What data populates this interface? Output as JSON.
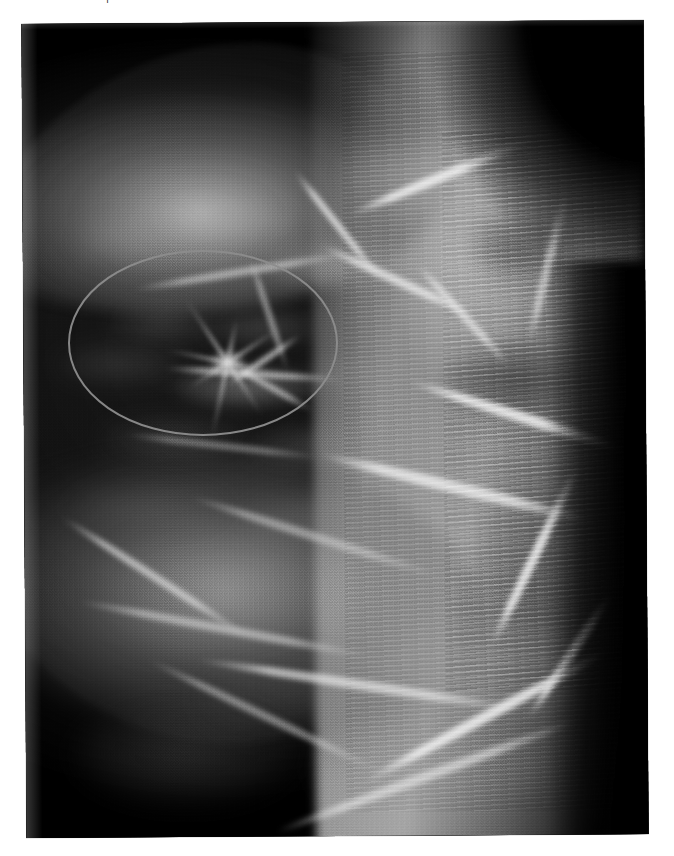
{
  "page": {
    "background_color": "#ffffff",
    "cut_text_fragment": "|"
  },
  "figure": {
    "name": "mammogram-radiograph",
    "modality": "Mammography",
    "view": "MLO (mediolateral oblique)",
    "plate": {
      "left": 24,
      "top": 22,
      "width": 622,
      "height": 814,
      "rotation_deg": -0.35,
      "background_color": "#050505"
    },
    "grayscale": {
      "darkest": "#000000",
      "fat_tissue": "#141414",
      "mid_tissue": "#8a8a8a",
      "dense_tissue": "#c8c8c8",
      "brightest": "#f2f2f2"
    }
  },
  "annotation": {
    "type": "ellipse",
    "label": "region-of-interest",
    "meaning": "spiculated mass / architectural distortion",
    "stroke_color": "#8d8d8d",
    "stroke_width": 2,
    "center_x": 203,
    "center_y": 343,
    "radius_x": 135,
    "radius_y": 93,
    "bounds": {
      "left": 91,
      "top": 272,
      "right": 362,
      "bottom": 458
    }
  },
  "findings": [
    {
      "name": "spiculated-mass",
      "center_x": 228,
      "center_y": 362,
      "description": "Small high-density focus with radiating spicules at the centre of the marked ellipse."
    },
    {
      "name": "dense-pectoral-band",
      "description": "Bright dense band sweeping from upper right to lower centre."
    },
    {
      "name": "scan-line-artefact",
      "description": "Repeating horizontal striping over the dense right portion of the film."
    }
  ],
  "tissue_blobs": [
    {
      "x": 60,
      "y": 200,
      "w": 120,
      "h": 52,
      "c": "rgba(150,150,150,0.42)",
      "b": 9
    },
    {
      "x": 150,
      "y": 186,
      "w": 130,
      "h": 44,
      "c": "rgba(165,165,165,0.40)",
      "b": 9
    },
    {
      "x": 250,
      "y": 228,
      "w": 150,
      "h": 50,
      "c": "rgba(180,180,180,0.52)",
      "b": 8
    },
    {
      "x": 95,
      "y": 290,
      "w": 110,
      "h": 40,
      "c": "rgba(130,130,130,0.34)",
      "b": 9
    },
    {
      "x": 190,
      "y": 296,
      "w": 120,
      "h": 38,
      "c": "rgba(140,140,140,0.38)",
      "b": 9
    },
    {
      "x": 40,
      "y": 330,
      "w": 130,
      "h": 42,
      "c": "rgba(120,120,120,0.30)",
      "b": 10
    },
    {
      "x": 160,
      "y": 352,
      "w": 145,
      "h": 44,
      "c": "rgba(175,175,175,0.50)",
      "b": 7
    },
    {
      "x": 290,
      "y": 340,
      "w": 140,
      "h": 46,
      "c": "rgba(150,150,150,0.40)",
      "b": 9
    },
    {
      "x": 85,
      "y": 404,
      "w": 150,
      "h": 44,
      "c": "rgba(125,125,125,0.32)",
      "b": 10
    },
    {
      "x": 230,
      "y": 412,
      "w": 150,
      "h": 46,
      "c": "rgba(140,140,140,0.36)",
      "b": 9
    },
    {
      "x": 55,
      "y": 470,
      "w": 160,
      "h": 50,
      "c": "rgba(120,120,120,0.28)",
      "b": 11
    },
    {
      "x": 225,
      "y": 480,
      "w": 170,
      "h": 52,
      "c": "rgba(135,135,135,0.33)",
      "b": 10
    },
    {
      "x": 120,
      "y": 548,
      "w": 180,
      "h": 56,
      "c": "rgba(115,115,115,0.26)",
      "b": 12
    },
    {
      "x": 300,
      "y": 560,
      "w": 190,
      "h": 58,
      "c": "rgba(150,150,150,0.38)",
      "b": 11
    },
    {
      "x": 330,
      "y": 120,
      "w": 180,
      "h": 90,
      "c": "rgba(190,190,190,0.55)",
      "b": 11
    },
    {
      "x": 410,
      "y": 60,
      "w": 150,
      "h": 80,
      "c": "rgba(120,120,120,0.35)",
      "b": 12
    },
    {
      "x": 455,
      "y": 200,
      "w": 120,
      "h": 70,
      "c": "rgba(60,60,60,0.55)",
      "b": 10
    },
    {
      "x": 430,
      "y": 330,
      "w": 150,
      "h": 80,
      "c": "rgba(40,40,40,0.60)",
      "b": 11
    },
    {
      "x": 360,
      "y": 600,
      "w": 210,
      "h": 110,
      "c": "rgba(175,175,175,0.48)",
      "b": 12
    },
    {
      "x": 180,
      "y": 640,
      "w": 200,
      "h": 90,
      "c": "rgba(105,105,105,0.22)",
      "b": 13
    },
    {
      "x": 60,
      "y": 690,
      "w": 220,
      "h": 100,
      "c": "rgba(130,130,130,0.30)",
      "b": 13
    },
    {
      "x": 300,
      "y": 700,
      "w": 230,
      "h": 110,
      "c": "rgba(160,160,160,0.40)",
      "b": 12
    }
  ],
  "tissue_strands": [
    {
      "x": 120,
      "y": 255,
      "w": 220,
      "h": 8,
      "r": -9,
      "c": "rgba(225,225,225,0.55)"
    },
    {
      "x": 255,
      "y": 210,
      "w": 140,
      "h": 7,
      "r": 52,
      "c": "rgba(245,245,245,0.72)"
    },
    {
      "x": 196,
      "y": 300,
      "w": 120,
      "h": 6,
      "r": 72,
      "c": "rgba(225,225,225,0.55)"
    },
    {
      "x": 150,
      "y": 358,
      "w": 180,
      "h": 7,
      "r": 4,
      "c": "rgba(235,235,235,0.62)"
    },
    {
      "x": 205,
      "y": 345,
      "w": 90,
      "h": 6,
      "r": -34,
      "c": "rgba(240,240,240,0.68)"
    },
    {
      "x": 210,
      "y": 372,
      "w": 95,
      "h": 6,
      "r": 30,
      "c": "rgba(235,235,235,0.62)"
    },
    {
      "x": 110,
      "y": 430,
      "w": 200,
      "h": 7,
      "r": 7,
      "c": "rgba(200,200,200,0.45)"
    },
    {
      "x": 300,
      "y": 265,
      "w": 170,
      "h": 9,
      "r": 25,
      "c": "rgba(245,245,245,0.70)"
    },
    {
      "x": 330,
      "y": 160,
      "w": 200,
      "h": 10,
      "r": -22,
      "c": "rgba(250,250,250,0.78)"
    },
    {
      "x": 390,
      "y": 400,
      "w": 230,
      "h": 11,
      "r": 18,
      "c": "rgba(250,250,250,0.80)"
    },
    {
      "x": 300,
      "y": 470,
      "w": 280,
      "h": 12,
      "r": 14,
      "c": "rgba(245,245,245,0.75)"
    },
    {
      "x": 170,
      "y": 520,
      "w": 260,
      "h": 9,
      "r": 18,
      "c": "rgba(215,215,215,0.52)"
    },
    {
      "x": 30,
      "y": 560,
      "w": 220,
      "h": 8,
      "r": 33,
      "c": "rgba(235,235,235,0.62)"
    },
    {
      "x": 60,
      "y": 612,
      "w": 300,
      "h": 9,
      "r": 11,
      "c": "rgba(225,225,225,0.55)"
    },
    {
      "x": 180,
      "y": 668,
      "w": 330,
      "h": 10,
      "r": 9,
      "c": "rgba(240,240,240,0.66)"
    },
    {
      "x": 120,
      "y": 700,
      "w": 260,
      "h": 8,
      "r": 26,
      "c": "rgba(220,220,220,0.50)"
    },
    {
      "x": 330,
      "y": 700,
      "w": 280,
      "h": 11,
      "r": -28,
      "c": "rgba(248,248,248,0.80)"
    },
    {
      "x": 250,
      "y": 760,
      "w": 320,
      "h": 10,
      "r": -20,
      "c": "rgba(235,235,235,0.62)"
    },
    {
      "x": 420,
      "y": 540,
      "w": 200,
      "h": 10,
      "r": -64,
      "c": "rgba(250,250,250,0.80)"
    },
    {
      "x": 455,
      "y": 250,
      "w": 160,
      "h": 9,
      "r": -76,
      "c": "rgba(235,235,235,0.60)"
    },
    {
      "x": 380,
      "y": 300,
      "w": 140,
      "h": 8,
      "r": 48,
      "c": "rgba(240,240,240,0.66)"
    },
    {
      "x": 480,
      "y": 640,
      "w": 150,
      "h": 9,
      "r": -56,
      "c": "rgba(250,250,250,0.78)"
    }
  ]
}
